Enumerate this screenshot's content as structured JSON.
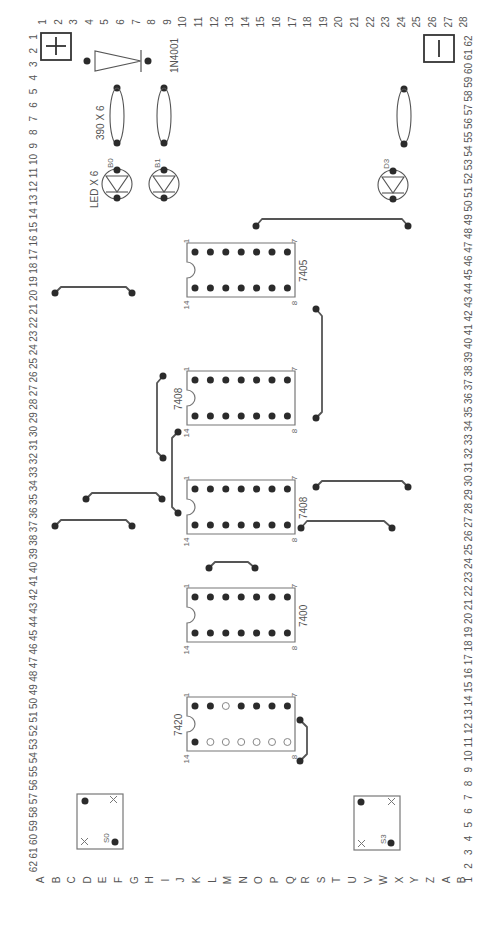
{
  "diagram": {
    "orientation": "rotated-90",
    "grid": {
      "left_row_numbers": [
        "1",
        "2",
        "3",
        "4",
        "5",
        "6",
        "7",
        "8",
        "9",
        "10",
        "11",
        "12",
        "13",
        "14",
        "15",
        "16",
        "17",
        "18",
        "19",
        "20",
        "21",
        "22",
        "23",
        "24",
        "25",
        "26",
        "27",
        "28",
        "29",
        "30",
        "31",
        "32",
        "33",
        "34",
        "35",
        "36",
        "37",
        "38",
        "39",
        "40",
        "41",
        "42",
        "43",
        "44",
        "45",
        "46",
        "47",
        "48",
        "49",
        "50",
        "51",
        "52",
        "53",
        "54",
        "55",
        "56",
        "57",
        "58",
        "59",
        "60",
        "61",
        "62"
      ],
      "right_row_numbers": [
        "62",
        "61",
        "60",
        "59",
        "58",
        "57",
        "56",
        "55",
        "54",
        "53",
        "52",
        "51",
        "50",
        "49",
        "48",
        "47",
        "46",
        "45",
        "44",
        "43",
        "42",
        "41",
        "40",
        "39",
        "38",
        "37",
        "36",
        "35",
        "34",
        "33",
        "32",
        "31",
        "30",
        "29",
        "28",
        "27",
        "26",
        "25",
        "24",
        "23",
        "22",
        "21",
        "20",
        "19",
        "18",
        "17",
        "16",
        "15",
        "14",
        "13",
        "12",
        "11",
        "10",
        "9",
        "8",
        "7",
        "6",
        "5",
        "4",
        "3",
        "2",
        "1"
      ],
      "column_letters": [
        "A",
        "B",
        "C",
        "D",
        "E",
        "F",
        "G",
        "H",
        "I",
        "J",
        "K",
        "L",
        "M",
        "N",
        "O",
        "P",
        "Q",
        "R",
        "S",
        "T",
        "U",
        "V",
        "W",
        "X",
        "Y",
        "Z",
        "A",
        "B"
      ],
      "top_column_numbers": [
        "1",
        "2",
        "3",
        "4",
        "5",
        "6",
        "7",
        "8",
        "9",
        "10",
        "11",
        "12",
        "13",
        "14",
        "15",
        "16",
        "17",
        "18",
        "19",
        "20",
        "21",
        "22",
        "23",
        "24",
        "25",
        "26",
        "27",
        "28"
      ]
    },
    "power": {
      "positive_symbol": "+",
      "negative_symbol": "—"
    },
    "components": {
      "diode": {
        "label": "1N4001"
      },
      "resistors": {
        "label": "390 X 6"
      },
      "leds": {
        "label": "LED X 6",
        "names": [
          "B0",
          "B1",
          "D3"
        ]
      },
      "switches": {
        "names": [
          "S0",
          "S3"
        ]
      },
      "ics": [
        {
          "part": "7405",
          "pin_first": "1",
          "pin_last_top": "7",
          "pin_bottom_first": "14",
          "pin_bottom_last": "8"
        },
        {
          "part": "7408",
          "pin_first": "1",
          "pin_last_top": "7",
          "pin_bottom_first": "14",
          "pin_bottom_last": "8"
        },
        {
          "part": "7408",
          "pin_first": "1",
          "pin_last_top": "7",
          "pin_bottom_first": "14",
          "pin_bottom_last": "8"
        },
        {
          "part": "7400",
          "pin_first": "1",
          "pin_last_top": "7",
          "pin_bottom_first": "14",
          "pin_bottom_last": "8"
        },
        {
          "part": "7420",
          "pin_first": "1",
          "pin_last_top": "7",
          "pin_bottom_first": "14",
          "pin_bottom_last": "8"
        }
      ]
    }
  }
}
